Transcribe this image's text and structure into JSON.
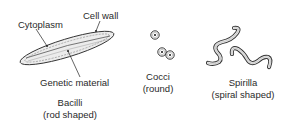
{
  "diagram": {
    "type": "labeled illustration",
    "groups": [
      {
        "name": "Bacilli",
        "caption": "(rod shaped)",
        "parts": [
          "Cytoplasm",
          "Cell wall",
          "Genetic material"
        ]
      },
      {
        "name": "Cocci",
        "caption": "(round)"
      },
      {
        "name": "Spirilla",
        "caption": "(spiral shaped)"
      }
    ]
  },
  "labels": {
    "cytoplasm": "Cytoplasm",
    "cell_wall": "Cell wall",
    "genetic_material": "Genetic material",
    "bacilli": "Bacilli",
    "bacilli_caption": "(rod shaped)",
    "cocci": "Cocci",
    "cocci_caption": "(round)",
    "spirilla": "Spirilla",
    "spirilla_caption": "(spiral shaped)"
  },
  "colors": {
    "ink": "#222222",
    "fill": "#e8e8e8",
    "background": "#ffffff"
  }
}
